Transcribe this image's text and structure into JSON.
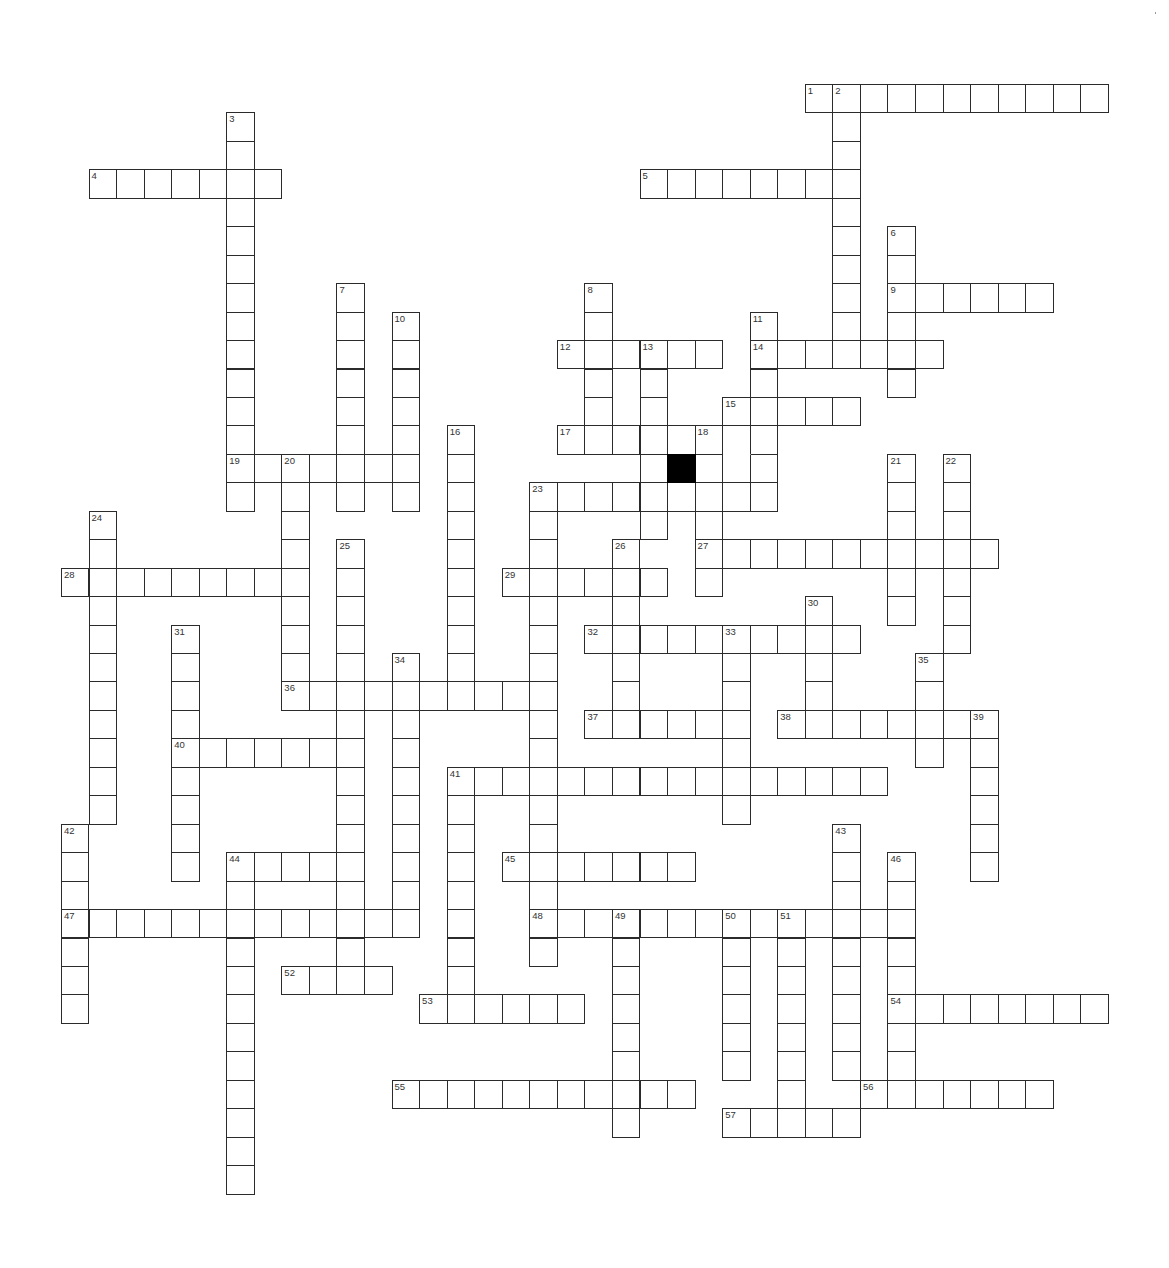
{
  "puzzle": {
    "title": "",
    "grid": {
      "origin_x": 88.5,
      "origin_y": 84,
      "cell_w": 27.55,
      "cell_h": 28.45,
      "line_color": "#2b2b2b",
      "block_color": "#000000"
    },
    "black_squares": [
      {
        "row": 13,
        "col": 21
      }
    ],
    "merged_cells": [
      {
        "row": 12,
        "col": 23,
        "open_side": "bottom"
      }
    ],
    "words": [
      {
        "num": 1,
        "dir": "across",
        "row": 0,
        "col": 26,
        "len": 11
      },
      {
        "num": 2,
        "dir": "down",
        "row": 0,
        "col": 27,
        "len": 10
      },
      {
        "num": 3,
        "dir": "down",
        "row": 1,
        "col": 5,
        "len": 14
      },
      {
        "num": 4,
        "dir": "across",
        "row": 3,
        "col": 0,
        "len": 7
      },
      {
        "num": 5,
        "dir": "across",
        "row": 3,
        "col": 20,
        "len": 8
      },
      {
        "num": 6,
        "dir": "down",
        "row": 5,
        "col": 29,
        "len": 6
      },
      {
        "num": 7,
        "dir": "down",
        "row": 7,
        "col": 9,
        "len": 8
      },
      {
        "num": 8,
        "dir": "down",
        "row": 7,
        "col": 18,
        "len": 6
      },
      {
        "num": 9,
        "dir": "across",
        "row": 7,
        "col": 29,
        "len": 6
      },
      {
        "num": 10,
        "dir": "down",
        "row": 8,
        "col": 11,
        "len": 7
      },
      {
        "num": 11,
        "dir": "down",
        "row": 8,
        "col": 24,
        "len": 7
      },
      {
        "num": 12,
        "dir": "across",
        "row": 9,
        "col": 17,
        "len": 6
      },
      {
        "num": 13,
        "dir": "down",
        "row": 9,
        "col": 20,
        "len": 7
      },
      {
        "num": 14,
        "dir": "across",
        "row": 9,
        "col": 24,
        "len": 7
      },
      {
        "num": 15,
        "dir": "across",
        "row": 11,
        "col": 23,
        "len": 5
      },
      {
        "num": 15,
        "dir": "down",
        "row": 11,
        "col": 23,
        "len": 4
      },
      {
        "num": 16,
        "dir": "down",
        "row": 12,
        "col": 13,
        "len": 10
      },
      {
        "num": 17,
        "dir": "across",
        "row": 12,
        "col": 17,
        "len": 8
      },
      {
        "num": 18,
        "dir": "down",
        "row": 12,
        "col": 22,
        "len": 6
      },
      {
        "num": 19,
        "dir": "across",
        "row": 13,
        "col": 5,
        "len": 7
      },
      {
        "num": 20,
        "dir": "down",
        "row": 13,
        "col": 7,
        "len": 9
      },
      {
        "num": 21,
        "dir": "down",
        "row": 13,
        "col": 29,
        "len": 6
      },
      {
        "num": 22,
        "dir": "down",
        "row": 13,
        "col": 31,
        "len": 7
      },
      {
        "num": 23,
        "dir": "across",
        "row": 14,
        "col": 16,
        "len": 9
      },
      {
        "num": 23,
        "dir": "down",
        "row": 14,
        "col": 16,
        "len": 17
      },
      {
        "num": 24,
        "dir": "down",
        "row": 15,
        "col": 0,
        "len": 11
      },
      {
        "num": 25,
        "dir": "down",
        "row": 16,
        "col": 9,
        "len": 16
      },
      {
        "num": 26,
        "dir": "down",
        "row": 16,
        "col": 19,
        "len": 7
      },
      {
        "num": 27,
        "dir": "across",
        "row": 16,
        "col": 22,
        "len": 11
      },
      {
        "num": 28,
        "dir": "across",
        "row": 17,
        "col": -1,
        "len": 9
      },
      {
        "num": 29,
        "dir": "across",
        "row": 17,
        "col": 15,
        "len": 6
      },
      {
        "num": 30,
        "dir": "down",
        "row": 18,
        "col": 26,
        "len": 5
      },
      {
        "num": 31,
        "dir": "down",
        "row": 19,
        "col": 3,
        "len": 9
      },
      {
        "num": 32,
        "dir": "across",
        "row": 19,
        "col": 18,
        "len": 10
      },
      {
        "num": 33,
        "dir": "down",
        "row": 19,
        "col": 23,
        "len": 7
      },
      {
        "num": 34,
        "dir": "down",
        "row": 20,
        "col": 11,
        "len": 10
      },
      {
        "num": 35,
        "dir": "down",
        "row": 20,
        "col": 30,
        "len": 4
      },
      {
        "num": 36,
        "dir": "across",
        "row": 21,
        "col": 7,
        "len": 10
      },
      {
        "num": 37,
        "dir": "across",
        "row": 22,
        "col": 18,
        "len": 6
      },
      {
        "num": 38,
        "dir": "across",
        "row": 22,
        "col": 25,
        "len": 8
      },
      {
        "num": 39,
        "dir": "down",
        "row": 22,
        "col": 32,
        "len": 6
      },
      {
        "num": 40,
        "dir": "across",
        "row": 23,
        "col": 3,
        "len": 7
      },
      {
        "num": 41,
        "dir": "across",
        "row": 24,
        "col": 13,
        "len": 16
      },
      {
        "num": 41,
        "dir": "down",
        "row": 24,
        "col": 13,
        "len": 9
      },
      {
        "num": 42,
        "dir": "down",
        "row": 26,
        "col": -1,
        "len": 7
      },
      {
        "num": 43,
        "dir": "down",
        "row": 26,
        "col": 27,
        "len": 9
      },
      {
        "num": 44,
        "dir": "across",
        "row": 27,
        "col": 5,
        "len": 5
      },
      {
        "num": 44,
        "dir": "down",
        "row": 27,
        "col": 5,
        "len": 12
      },
      {
        "num": 45,
        "dir": "across",
        "row": 27,
        "col": 15,
        "len": 7
      },
      {
        "num": 46,
        "dir": "down",
        "row": 27,
        "col": 29,
        "len": 9
      },
      {
        "num": 47,
        "dir": "across",
        "row": 29,
        "col": -1,
        "len": 13
      },
      {
        "num": 48,
        "dir": "across",
        "row": 29,
        "col": 16,
        "len": 14
      },
      {
        "num": 49,
        "dir": "down",
        "row": 29,
        "col": 19,
        "len": 8
      },
      {
        "num": 50,
        "dir": "down",
        "row": 29,
        "col": 23,
        "len": 6
      },
      {
        "num": 51,
        "dir": "down",
        "row": 29,
        "col": 25,
        "len": 8
      },
      {
        "num": 52,
        "dir": "across",
        "row": 31,
        "col": 7,
        "len": 4
      },
      {
        "num": 53,
        "dir": "across",
        "row": 32,
        "col": 12,
        "len": 6
      },
      {
        "num": 54,
        "dir": "across",
        "row": 32,
        "col": 29,
        "len": 8
      },
      {
        "num": 55,
        "dir": "across",
        "row": 35,
        "col": 11,
        "len": 11
      },
      {
        "num": 56,
        "dir": "across",
        "row": 35,
        "col": 28,
        "len": 7
      },
      {
        "num": 57,
        "dir": "across",
        "row": 36,
        "col": 23,
        "len": 5
      }
    ],
    "entries": {}
  }
}
